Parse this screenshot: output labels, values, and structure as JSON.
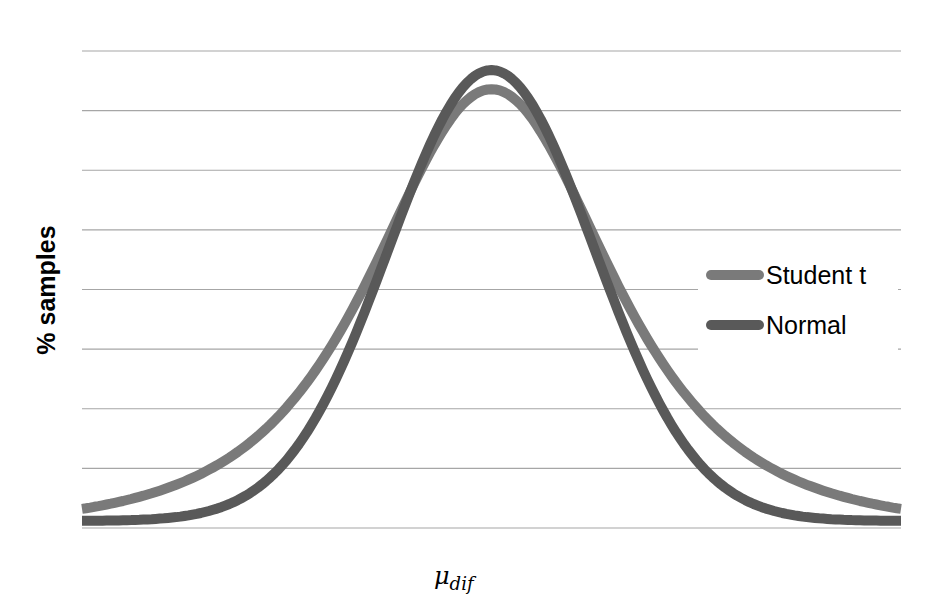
{
  "chart_data": {
    "type": "line",
    "title": "",
    "xlabel": "μ_dif",
    "xlabel_main": "μ",
    "xlabel_sub": "dif",
    "ylabel": "% samples",
    "grid": true,
    "gridlines": 9,
    "legend_position": "right",
    "x_range": [
      -4,
      4
    ],
    "series": [
      {
        "name": "Student t",
        "color": "#7a7a7a",
        "peak": 0.92,
        "tail": 0.04,
        "kind": "t"
      },
      {
        "name": "Normal",
        "color": "#595959",
        "peak": 0.96,
        "tail": 0.015,
        "kind": "normal"
      }
    ]
  },
  "plot": {
    "left": 82,
    "right": 901,
    "top": 51,
    "bottom": 528
  },
  "legend": {
    "items": [
      {
        "label": "Student t",
        "color": "#7a7a7a"
      },
      {
        "label": "Normal",
        "color": "#595959"
      }
    ]
  }
}
